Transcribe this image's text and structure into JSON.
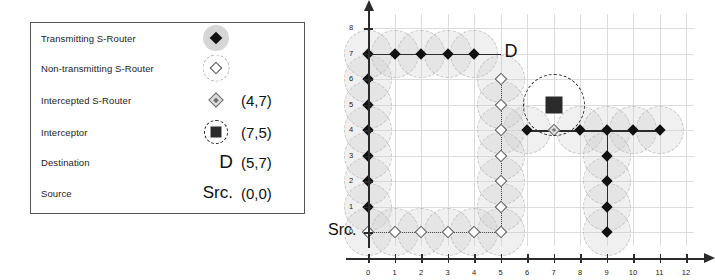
{
  "legend": {
    "rows": [
      {
        "label": "Transmitting S-Router",
        "symbol": "filled-diamond-with-gray-disc",
        "coord": ""
      },
      {
        "label": "Non-transmitting S-Router",
        "symbol": "hollow-diamond-with-dashed-circle",
        "coord": ""
      },
      {
        "label": "Intercepted S-Router",
        "symbol": "small-gray-diamond",
        "coord": "(4,7)"
      },
      {
        "label": "Interceptor",
        "symbol": "dark-square-with-dashed-circle",
        "coord": "(7,5)"
      },
      {
        "label": "Destination",
        "symbol": "D",
        "coord": "(5,7)"
      },
      {
        "label": "Source",
        "symbol": "Src.",
        "coord": "(0,0)"
      }
    ]
  },
  "chart_data": {
    "type": "scatter",
    "title": "",
    "xlabel": "",
    "ylabel": "",
    "xlim": [
      0,
      12
    ],
    "ylim": [
      0,
      8
    ],
    "xticks": [
      0,
      1,
      2,
      3,
      4,
      5,
      6,
      7,
      8,
      9,
      10,
      11,
      12
    ],
    "yticks": [
      0,
      1,
      2,
      3,
      4,
      5,
      6,
      7,
      8
    ],
    "grid": true,
    "legend_position": "external-left",
    "series": [
      {
        "name": "Transmitting S-Router",
        "marker": "filled-diamond",
        "points": [
          [
            0,
            1
          ],
          [
            0,
            2
          ],
          [
            0,
            3
          ],
          [
            0,
            4
          ],
          [
            0,
            5
          ],
          [
            0,
            6
          ],
          [
            0,
            7
          ],
          [
            1,
            7
          ],
          [
            2,
            7
          ],
          [
            3,
            7
          ],
          [
            4,
            7
          ],
          [
            6,
            4
          ],
          [
            8,
            4
          ],
          [
            9,
            4
          ],
          [
            10,
            4
          ],
          [
            11,
            4
          ],
          [
            9,
            0
          ],
          [
            9,
            1
          ],
          [
            9,
            2
          ],
          [
            9,
            3
          ]
        ]
      },
      {
        "name": "Non-transmitting S-Router",
        "marker": "hollow-diamond",
        "points": [
          [
            0,
            0
          ],
          [
            1,
            0
          ],
          [
            2,
            0
          ],
          [
            3,
            0
          ],
          [
            4,
            0
          ],
          [
            5,
            0
          ],
          [
            5,
            1
          ],
          [
            5,
            2
          ],
          [
            5,
            3
          ],
          [
            5,
            4
          ],
          [
            5,
            5
          ],
          [
            5,
            6
          ]
        ]
      },
      {
        "name": "Intercepted S-Router",
        "marker": "small-gray-diamond",
        "points": [
          [
            7,
            4
          ]
        ]
      },
      {
        "name": "Interceptor",
        "marker": "dark-square-with-dashed-circle",
        "points": [
          [
            7,
            5
          ]
        ]
      }
    ],
    "annotations": [
      {
        "text": "D",
        "x": 5,
        "y": 7,
        "role": "destination-label"
      },
      {
        "text": "Src.",
        "x": 0,
        "y": 0,
        "role": "source-label"
      }
    ],
    "paths": [
      {
        "style": "solid",
        "name": "transmitting-route",
        "vertices": [
          [
            0,
            1
          ],
          [
            0,
            7
          ],
          [
            5,
            7
          ]
        ]
      },
      {
        "style": "dotted",
        "name": "non-transmitting-route",
        "vertices": [
          [
            0,
            0
          ],
          [
            5,
            0
          ],
          [
            5,
            6
          ]
        ]
      },
      {
        "style": "solid",
        "name": "lower-right-route",
        "vertices": [
          [
            6,
            4
          ],
          [
            11,
            4
          ]
        ]
      },
      {
        "style": "solid",
        "name": "lower-right-branch",
        "vertices": [
          [
            9,
            0
          ],
          [
            9,
            4
          ]
        ]
      }
    ]
  },
  "colors": {
    "marker_filled": "#111111",
    "marker_hollow_stroke": "#555555",
    "interceptor": "#2a2a2a",
    "coverage_halo": "#cdcdcd",
    "axis": "#2b2b2b",
    "grid": "#dcdcdc"
  }
}
